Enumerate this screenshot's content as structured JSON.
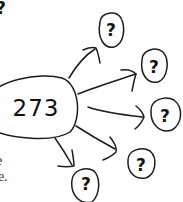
{
  "diagram": {
    "type": "hand-drawn mind map",
    "center_node": {
      "label": "273"
    },
    "branch_nodes": [
      {
        "label": "?"
      },
      {
        "label": "?"
      },
      {
        "label": "?"
      },
      {
        "label": "?"
      },
      {
        "label": "?"
      }
    ],
    "edges": [
      {
        "from": "273",
        "to": "branch_1"
      },
      {
        "from": "273",
        "to": "branch_2"
      },
      {
        "from": "273",
        "to": "branch_3"
      },
      {
        "from": "273",
        "to": "branch_4"
      },
      {
        "from": "273",
        "to": "branch_5"
      }
    ]
  },
  "cropped_text": {
    "top_left": "?",
    "bottom_left_line1": "e",
    "bottom_left_line2": "le."
  },
  "colors": {
    "ink": "#1c1c1c",
    "background": "#ffffff",
    "text": "#333333"
  }
}
